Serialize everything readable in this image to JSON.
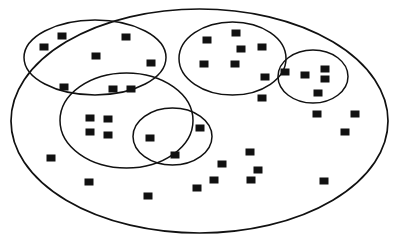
{
  "figure": {
    "title": "",
    "background_color": "#ffffff",
    "stroke_color": "#111111",
    "point_color": "#111111",
    "width": 410,
    "height": 245,
    "point_shape": "square"
  },
  "chart_data": {
    "type": "scatter",
    "title": "",
    "xlabel": "",
    "ylabel": "",
    "xlim": [
      0,
      410
    ],
    "ylim": [
      0,
      245
    ],
    "grid": false,
    "legend": "none",
    "marker": "square",
    "marker_color": "#111111",
    "clusters": [
      {
        "name": "outer-boundary",
        "role": "outer",
        "cx": 199.5,
        "cy": 121.0,
        "rx": 188.5,
        "ry": 112.0,
        "rotation": 0
      },
      {
        "name": "cluster-top-left",
        "role": "inner",
        "cx": 95.0,
        "cy": 57.5,
        "rx": 71.0,
        "ry": 37.5,
        "rotation": 0
      },
      {
        "name": "cluster-top-right",
        "role": "inner",
        "cx": 232.5,
        "cy": 58.5,
        "rx": 53.5,
        "ry": 36.5,
        "rotation": 0
      },
      {
        "name": "cluster-right-small",
        "role": "inner",
        "cx": 313.0,
        "cy": 76.5,
        "rx": 35.0,
        "ry": 26.5,
        "rotation": 0
      },
      {
        "name": "cluster-middle",
        "role": "inner",
        "cx": 126.5,
        "cy": 120.5,
        "rx": 66.5,
        "ry": 47.5,
        "rotation": 0
      },
      {
        "name": "cluster-bottom-small",
        "role": "inner",
        "cx": 172.5,
        "cy": 136.5,
        "rx": 39.5,
        "ry": 28.5,
        "rotation": 0
      }
    ],
    "points": [
      {
        "x": 62,
        "y": 36,
        "w": 9,
        "h": 7
      },
      {
        "x": 44,
        "y": 47,
        "w": 9,
        "h": 7
      },
      {
        "x": 126,
        "y": 37,
        "w": 9,
        "h": 7
      },
      {
        "x": 96,
        "y": 56,
        "w": 9,
        "h": 7
      },
      {
        "x": 151,
        "y": 63,
        "w": 9,
        "h": 7
      },
      {
        "x": 64,
        "y": 87,
        "w": 9,
        "h": 7
      },
      {
        "x": 113,
        "y": 89,
        "w": 9,
        "h": 7
      },
      {
        "x": 131,
        "y": 89,
        "w": 9,
        "h": 7
      },
      {
        "x": 207,
        "y": 40,
        "w": 9,
        "h": 7
      },
      {
        "x": 236,
        "y": 33,
        "w": 9,
        "h": 7
      },
      {
        "x": 241,
        "y": 49,
        "w": 9,
        "h": 7
      },
      {
        "x": 262,
        "y": 47,
        "w": 9,
        "h": 7
      },
      {
        "x": 204,
        "y": 64,
        "w": 9,
        "h": 7
      },
      {
        "x": 235,
        "y": 64,
        "w": 9,
        "h": 7
      },
      {
        "x": 265,
        "y": 77,
        "w": 9,
        "h": 7
      },
      {
        "x": 262,
        "y": 98,
        "w": 9,
        "h": 7
      },
      {
        "x": 285,
        "y": 72,
        "w": 9,
        "h": 7
      },
      {
        "x": 305,
        "y": 75,
        "w": 9,
        "h": 7
      },
      {
        "x": 325,
        "y": 69,
        "w": 9,
        "h": 7
      },
      {
        "x": 325,
        "y": 79,
        "w": 9,
        "h": 7
      },
      {
        "x": 318,
        "y": 93,
        "w": 9,
        "h": 7
      },
      {
        "x": 90,
        "y": 118,
        "w": 9,
        "h": 7
      },
      {
        "x": 108,
        "y": 119,
        "w": 9,
        "h": 7
      },
      {
        "x": 90,
        "y": 132,
        "w": 9,
        "h": 7
      },
      {
        "x": 108,
        "y": 135,
        "w": 9,
        "h": 7
      },
      {
        "x": 150,
        "y": 138,
        "w": 9,
        "h": 7
      },
      {
        "x": 200,
        "y": 128,
        "w": 9,
        "h": 7
      },
      {
        "x": 175,
        "y": 155,
        "w": 9,
        "h": 7
      },
      {
        "x": 51,
        "y": 158,
        "w": 9,
        "h": 7
      },
      {
        "x": 89,
        "y": 182,
        "w": 9,
        "h": 7
      },
      {
        "x": 148,
        "y": 196,
        "w": 9,
        "h": 7
      },
      {
        "x": 197,
        "y": 188,
        "w": 9,
        "h": 7
      },
      {
        "x": 250,
        "y": 152,
        "w": 9,
        "h": 7
      },
      {
        "x": 222,
        "y": 164,
        "w": 9,
        "h": 7
      },
      {
        "x": 258,
        "y": 170,
        "w": 9,
        "h": 7
      },
      {
        "x": 214,
        "y": 180,
        "w": 9,
        "h": 7
      },
      {
        "x": 251,
        "y": 180,
        "w": 9,
        "h": 7
      },
      {
        "x": 317,
        "y": 114,
        "w": 9,
        "h": 7
      },
      {
        "x": 355,
        "y": 114,
        "w": 9,
        "h": 7
      },
      {
        "x": 345,
        "y": 132,
        "w": 9,
        "h": 7
      },
      {
        "x": 324,
        "y": 181,
        "w": 9,
        "h": 7
      }
    ]
  }
}
